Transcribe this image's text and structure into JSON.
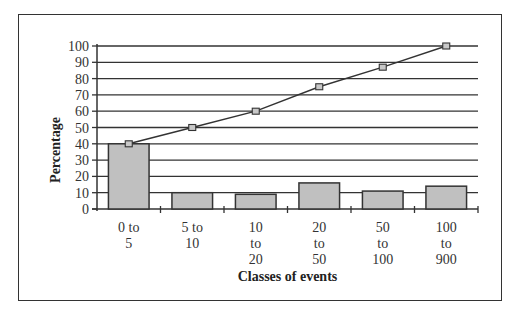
{
  "chart_data": {
    "type": "bar+line",
    "title": "",
    "xlabel": "Classes of events",
    "ylabel": "Percentage",
    "categories": [
      "0 to 5",
      "5 to 10",
      "10 to 20",
      "20 to 50",
      "50 to 100",
      "100 to 900"
    ],
    "category_label_lines": [
      [
        "0 to",
        "5"
      ],
      [
        "5 to",
        "10"
      ],
      [
        "10",
        "to",
        "20"
      ],
      [
        "20",
        "to",
        "50"
      ],
      [
        "50",
        "to",
        "100"
      ],
      [
        "100",
        "to",
        "900"
      ]
    ],
    "series": [
      {
        "name": "Percentage per class",
        "type": "bar",
        "values": [
          40,
          10,
          9,
          16,
          11,
          14
        ],
        "color": "#c0c0c0"
      },
      {
        "name": "Cumulative percentage",
        "type": "line",
        "values": [
          40,
          50,
          60,
          75,
          87,
          100
        ],
        "color": "#333333",
        "marker": "square"
      }
    ],
    "yticks": [
      0,
      10,
      20,
      30,
      40,
      50,
      60,
      70,
      80,
      90,
      100
    ],
    "ylim": [
      0,
      100
    ],
    "grid": true,
    "legend": "none"
  }
}
